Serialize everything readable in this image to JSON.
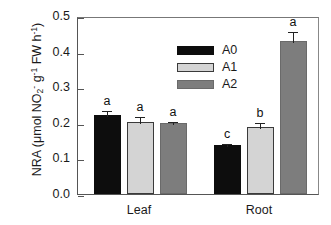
{
  "chart_data": {
    "type": "bar",
    "title": "",
    "xlabel": "",
    "ylabel": "NRA (μmol NO2- g-1 FW h-1)",
    "ylabel_parts": {
      "prefix": "NRA (μmol NO",
      "sub1": "2",
      "sup1": "-",
      "mid": " g",
      "sup2": "-1",
      "mid2": " FW h",
      "sup3": "-1",
      "suffix": ")"
    },
    "categories": [
      "Leaf",
      "Root"
    ],
    "series": [
      {
        "name": "A0",
        "color": "#0d0d0d",
        "values": [
          0.222,
          0.138
        ],
        "errors": [
          0.017,
          0.008
        ],
        "letters": [
          "a",
          "c"
        ]
      },
      {
        "name": "A1",
        "color": "#d4d4d4",
        "values": [
          0.203,
          0.188
        ],
        "errors": [
          0.018,
          0.018
        ],
        "letters": [
          "a",
          "b"
        ]
      },
      {
        "name": "A2",
        "color": "#7d7d7d",
        "values": [
          0.199,
          0.431
        ],
        "errors": [
          0.008,
          0.03
        ],
        "letters": [
          "a",
          "a"
        ]
      }
    ],
    "ylim": [
      0.0,
      0.5
    ],
    "yticks": [
      0.0,
      0.1,
      0.2,
      0.3,
      0.4,
      0.5
    ],
    "ytick_labels": [
      "0.0",
      "0.1",
      "0.2",
      "0.3",
      "0.4",
      "0.5"
    ],
    "grid": false,
    "legend_position": "upper-left-inside",
    "legend_entries": [
      "A0",
      "A1",
      "A2"
    ]
  }
}
